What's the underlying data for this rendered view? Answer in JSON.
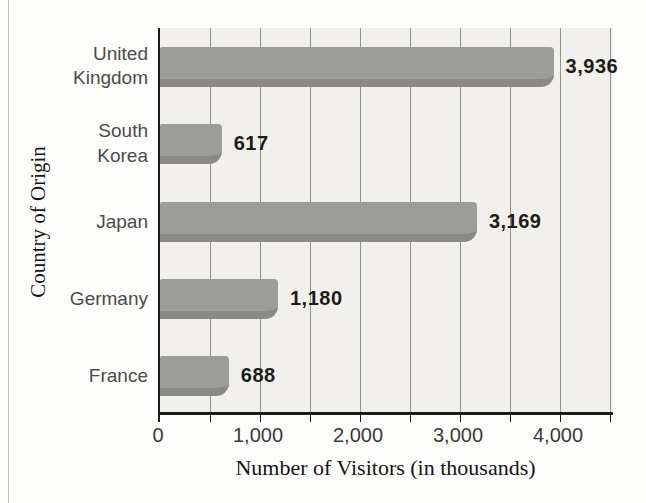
{
  "chart_data": {
    "type": "bar",
    "orientation": "horizontal",
    "title": "",
    "xlabel": "Number of Visitors (in thousands)",
    "ylabel": "Country of Origin",
    "categories": [
      "United Kingdom",
      "South Korea",
      "Japan",
      "Germany",
      "France"
    ],
    "category_display": [
      "United\nKingdom",
      "South\nKorea",
      "Japan",
      "Germany",
      "France"
    ],
    "values": [
      3936,
      617,
      3169,
      1180,
      688
    ],
    "value_labels": [
      "3,936",
      "617",
      "3,169",
      "1,180",
      "688"
    ],
    "xlim": [
      0,
      4550
    ],
    "gridline_step": 500,
    "grid": "vertical",
    "legend": "none",
    "x_ticks": [
      {
        "value": 0,
        "label": "0"
      },
      {
        "value": 1000,
        "label": "1,000"
      },
      {
        "value": 2000,
        "label": "2,000"
      },
      {
        "value": 3000,
        "label": "3,000"
      },
      {
        "value": 4000,
        "label": "4,000"
      }
    ],
    "colors": {
      "bar": "#9c9c98",
      "bar_shadow": "#8a8a83",
      "plot_background": "#f2f0ec",
      "gridline": "#94948f",
      "axis": "#1b1b1b",
      "category_label": "#4b4b49",
      "value_label": "#1c1c1a",
      "tick_label": "#3a3a38",
      "axis_title": "#141412"
    }
  }
}
